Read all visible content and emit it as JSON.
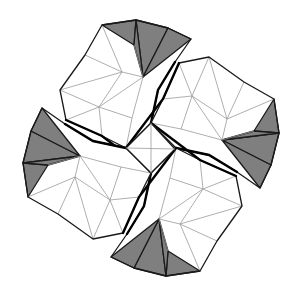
{
  "figure": {
    "title": "",
    "canvas": {
      "width": 302,
      "height": 292
    },
    "center": [
      151,
      148
    ],
    "colors": {
      "background": "#ffffff",
      "shade": "#7f7f7f",
      "edge": "#1a1a1a",
      "mesh": "#9a9a9a"
    },
    "rotations": [
      0,
      90,
      180,
      270
    ],
    "center_square": [
      [
        151,
        123
      ],
      [
        175,
        149
      ],
      [
        151,
        173
      ],
      [
        126,
        148
      ]
    ],
    "petal": {
      "outline": [
        [
          102,
          25
        ],
        [
          136,
          20
        ],
        [
          168,
          28
        ],
        [
          191,
          39
        ],
        [
          175,
          62
        ],
        [
          158,
          90
        ],
        [
          151,
          123
        ],
        [
          126,
          148
        ],
        [
          102,
          136
        ],
        [
          66,
          120
        ],
        [
          60,
          90
        ],
        [
          85,
          55
        ]
      ],
      "gray_triangles": [
        [
          [
            102,
            25
          ],
          [
            136,
            20
          ],
          [
            134,
            45
          ]
        ],
        [
          [
            136,
            20
          ],
          [
            168,
            28
          ],
          [
            143,
            77
          ]
        ],
        [
          [
            136,
            20
          ],
          [
            134,
            45
          ],
          [
            143,
            77
          ]
        ],
        [
          [
            168,
            28
          ],
          [
            191,
            39
          ],
          [
            143,
            77
          ]
        ]
      ],
      "mesh_lines": [
        [
          [
            102,
            25
          ],
          [
            122,
            72
          ]
        ],
        [
          [
            85,
            55
          ],
          [
            122,
            72
          ]
        ],
        [
          [
            122,
            72
          ],
          [
            143,
            77
          ]
        ],
        [
          [
            60,
            90
          ],
          [
            122,
            72
          ]
        ],
        [
          [
            60,
            90
          ],
          [
            99,
            107
          ]
        ],
        [
          [
            122,
            72
          ],
          [
            99,
            107
          ]
        ],
        [
          [
            99,
            107
          ],
          [
            143,
            77
          ]
        ],
        [
          [
            99,
            107
          ],
          [
            66,
            120
          ]
        ],
        [
          [
            99,
            107
          ],
          [
            102,
            136
          ]
        ],
        [
          [
            99,
            107
          ],
          [
            132,
            118
          ]
        ],
        [
          [
            143,
            77
          ],
          [
            132,
            118
          ]
        ],
        [
          [
            132,
            118
          ],
          [
            126,
            148
          ]
        ],
        [
          [
            143,
            77
          ],
          [
            134,
            45
          ]
        ]
      ],
      "thick_edges": [
        [
          [
            175,
            62
          ],
          [
            158,
            90
          ],
          [
            151,
            123
          ]
        ],
        [
          [
            66,
            120
          ],
          [
            102,
            136
          ],
          [
            151,
            173
          ]
        ]
      ]
    }
  }
}
